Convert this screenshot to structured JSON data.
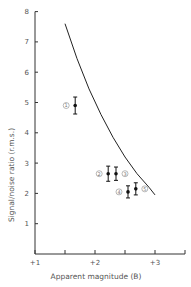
{
  "chart_data": {
    "type": "scatter",
    "title": "",
    "xlabel": "Apparent magnitude (B)",
    "ylabel": "Signal/noise ratio (r.m.s.)",
    "xlim": [
      1,
      3.5
    ],
    "ylim": [
      0,
      8
    ],
    "x_ticks": [
      1,
      1.5,
      2,
      2.5,
      3,
      3.5
    ],
    "x_tick_labels": [
      "+1",
      "",
      "+2",
      "",
      "+3",
      ""
    ],
    "y_ticks": [
      1,
      2,
      3,
      4,
      5,
      6,
      7,
      8
    ],
    "y_tick_labels": [
      "1",
      "2",
      "3",
      "4",
      "5",
      "6",
      "7",
      "8"
    ],
    "grid": false,
    "points": [
      {
        "label": "1",
        "x": 1.67,
        "y": 4.9,
        "err": 0.28
      },
      {
        "label": "2",
        "x": 2.22,
        "y": 2.65,
        "err": 0.25
      },
      {
        "label": "3",
        "x": 2.35,
        "y": 2.65,
        "err": 0.22
      },
      {
        "label": "4",
        "x": 2.55,
        "y": 2.05,
        "err": 0.2
      },
      {
        "label": "5",
        "x": 2.68,
        "y": 2.15,
        "err": 0.2
      }
    ],
    "curve": {
      "name": "theoretical",
      "x": [
        1.5,
        1.7,
        1.9,
        2.1,
        2.3,
        2.5,
        2.7,
        2.9,
        3.0
      ],
      "y": [
        7.6,
        6.45,
        5.45,
        4.6,
        3.85,
        3.2,
        2.65,
        2.2,
        1.95
      ]
    }
  }
}
